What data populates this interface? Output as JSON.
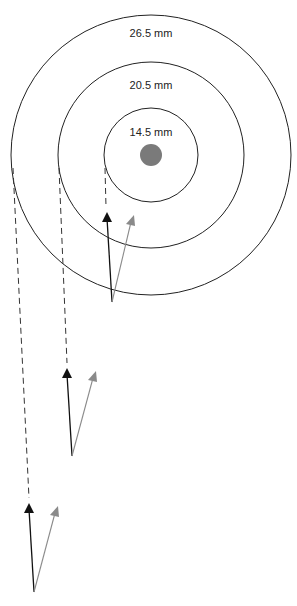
{
  "diagram": {
    "center": {
      "x": 151,
      "y": 155
    },
    "dot": {
      "r": 11,
      "color": "#7a7a7a"
    },
    "rings": [
      {
        "label": "14.5 mm",
        "r": 47,
        "label_y": 136
      },
      {
        "label": "20.5 mm",
        "r": 93,
        "label_y": 89
      },
      {
        "label": "26.5 mm",
        "r": 140,
        "label_y": 37
      }
    ],
    "arrow_sets": [
      {
        "dash_x": 105,
        "base": [
          112,
          302
        ],
        "black_tip": [
          107,
          213
        ],
        "gray_tip": [
          133,
          217
        ]
      },
      {
        "dash_x": 59,
        "base": [
          72,
          456
        ],
        "black_tip": [
          67,
          369
        ],
        "gray_tip": [
          95,
          373
        ]
      },
      {
        "dash_x": 13,
        "base": [
          34,
          592
        ],
        "black_tip": [
          29,
          504
        ],
        "gray_tip": [
          57,
          508
        ]
      }
    ],
    "colors": {
      "ring": "#222222",
      "black_arrow": "#111111",
      "gray_arrow": "#8a8a8a",
      "dash": "#333333"
    }
  }
}
